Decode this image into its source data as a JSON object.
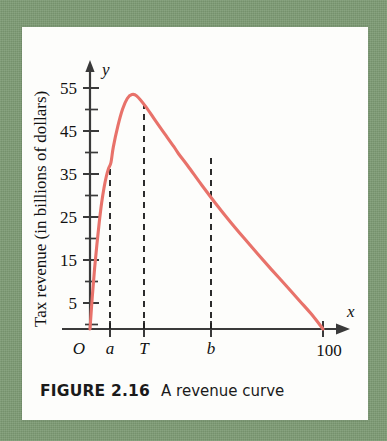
{
  "figure": {
    "caption_label": "FIGURE 2.16",
    "caption_text": "A revenue curve",
    "background_color": "#7d9b74",
    "panel_color": "#fdfdfb"
  },
  "chart_data": {
    "type": "line",
    "title": "",
    "xlabel": "Tax rate (percent)",
    "ylabel": "Tax revenue (in billions of dollars)",
    "x_axis_variable": "x",
    "y_axis_variable": "y",
    "origin_label": "O",
    "xlim": [
      0,
      108
    ],
    "ylim": [
      0,
      60
    ],
    "x_tick_labels": [
      "a",
      "T",
      "b",
      "100"
    ],
    "x_tick_values": [
      9,
      18,
      38,
      100
    ],
    "y_tick_labels": [
      "5",
      "15",
      "25",
      "35",
      "45",
      "55"
    ],
    "y_tick_values": [
      5,
      15,
      25,
      35,
      45,
      55
    ],
    "y_minor_ticks": [
      10,
      20,
      30,
      40,
      50
    ],
    "grid": false,
    "legend": null,
    "curve_color": "#e8726a",
    "axis_color": "#3a3a3a",
    "dashed_line_color": "#222222",
    "annotations": [
      {
        "label": "a",
        "x": 9,
        "y": 38,
        "note": "lower tax rate giving revenue below maximum"
      },
      {
        "label": "T",
        "x": 18,
        "y": 53.5,
        "note": "tax rate at maximum revenue"
      },
      {
        "label": "b",
        "x": 38,
        "y": 40,
        "note": "higher tax rate giving same-ish revenue"
      }
    ],
    "x": [
      0,
      1,
      2,
      3,
      4,
      5,
      6,
      7,
      8,
      9,
      10,
      12,
      14,
      16,
      18,
      20,
      24,
      28,
      32,
      36,
      38,
      42,
      48,
      54,
      60,
      66,
      72,
      78,
      84,
      90,
      95,
      100
    ],
    "values": [
      0,
      7.5,
      14.0,
      19.5,
      24.5,
      28.8,
      32.2,
      34.8,
      36.7,
      38.0,
      41.5,
      46.4,
      50.2,
      52.6,
      53.5,
      53.2,
      50.7,
      47.6,
      44.6,
      41.6,
      40.0,
      37.2,
      32.8,
      28.6,
      24.6,
      20.8,
      17.1,
      13.5,
      10.0,
      6.4,
      3.4,
      0
    ],
    "peak": {
      "x": 18,
      "y": 53.5
    }
  }
}
